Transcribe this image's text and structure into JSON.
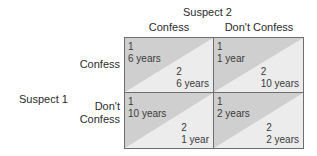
{
  "column_player": "Suspect 2",
  "row_player": "Suspect 1",
  "columns": [
    "Confess",
    "Don't Confess"
  ],
  "rows": [
    {
      "label_lines": [
        "Confess"
      ]
    },
    {
      "label_lines": [
        "Don't",
        "Confess"
      ]
    }
  ],
  "cells": [
    [
      {
        "p1_label": "1",
        "p1_value": "6 years",
        "p2_label": "2",
        "p2_value": "6 years"
      },
      {
        "p1_label": "1",
        "p1_value": "1 year",
        "p2_label": "2",
        "p2_value": "10 years"
      }
    ],
    [
      {
        "p1_label": "1",
        "p1_value": "10 years",
        "p2_label": "2",
        "p2_value": "1 year"
      },
      {
        "p1_label": "1",
        "p1_value": "2 years",
        "p2_label": "2",
        "p2_value": "2 years"
      }
    ]
  ],
  "colors": {
    "cell_dark_half": "#cfcfcf",
    "cell_light_half": "#ececec",
    "border": "#6e6e6e",
    "text": "#333333"
  }
}
